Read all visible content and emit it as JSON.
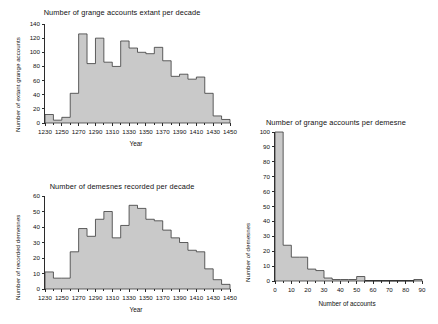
{
  "figure": {
    "background": "#ffffff",
    "bar_fill": "#c9c9c9",
    "bar_stroke": "#3a3a3a"
  },
  "chart_data": [
    {
      "id": "grange-accounts-per-decade",
      "type": "bar",
      "title": "Number of grange accounts extant per decade",
      "xlabel": "Year",
      "ylabel": "Number of extant grange accounts",
      "xlim": [
        1230,
        1450
      ],
      "ylim": [
        0,
        140
      ],
      "bin_width": 10,
      "grid": false,
      "legend": "none",
      "xticks": [
        1230,
        1250,
        1270,
        1290,
        1310,
        1330,
        1350,
        1370,
        1390,
        1410,
        1430,
        1450
      ],
      "yticks": [
        0,
        20,
        40,
        60,
        80,
        100,
        120,
        140
      ],
      "categories": [
        1230,
        1240,
        1250,
        1260,
        1270,
        1280,
        1290,
        1300,
        1310,
        1320,
        1330,
        1340,
        1350,
        1360,
        1370,
        1380,
        1390,
        1400,
        1410,
        1420,
        1430,
        1440
      ],
      "values": [
        12,
        4,
        8,
        42,
        126,
        84,
        120,
        86,
        80,
        116,
        106,
        100,
        98,
        107,
        88,
        66,
        69,
        62,
        65,
        42,
        10,
        5
      ]
    },
    {
      "id": "demesnes-recorded-per-decade",
      "type": "bar",
      "title": "Number of demesnes recorded per decade",
      "xlabel": "Year",
      "ylabel": "Number of recorded demesnes",
      "xlim": [
        1230,
        1450
      ],
      "ylim": [
        0,
        60
      ],
      "bin_width": 10,
      "grid": false,
      "legend": "none",
      "xticks": [
        1230,
        1250,
        1270,
        1290,
        1310,
        1330,
        1350,
        1370,
        1390,
        1410,
        1430,
        1450
      ],
      "yticks": [
        0,
        10,
        20,
        30,
        40,
        50,
        60
      ],
      "categories": [
        1230,
        1240,
        1250,
        1260,
        1270,
        1280,
        1290,
        1300,
        1310,
        1320,
        1330,
        1340,
        1350,
        1360,
        1370,
        1380,
        1390,
        1400,
        1410,
        1420,
        1430,
        1440
      ],
      "values": [
        11,
        7,
        7,
        24,
        39,
        34,
        45,
        50,
        33,
        41,
        54,
        52,
        45,
        44,
        38,
        33,
        30,
        25,
        24,
        13,
        6,
        3
      ]
    },
    {
      "id": "grange-accounts-per-demesne",
      "type": "bar",
      "title": "Number of grange accounts per demesne",
      "xlabel": "Number of accounts",
      "ylabel": "Number of demesnes",
      "xlim": [
        0,
        90
      ],
      "ylim": [
        0,
        100
      ],
      "bin_width": 5,
      "grid": false,
      "legend": "none",
      "xticks": [
        0,
        10,
        20,
        30,
        40,
        50,
        60,
        70,
        80,
        90
      ],
      "yticks": [
        0,
        10,
        20,
        30,
        40,
        50,
        60,
        70,
        80,
        90,
        100
      ],
      "categories": [
        0,
        5,
        10,
        15,
        20,
        25,
        30,
        35,
        40,
        45,
        50,
        55,
        60,
        65,
        70,
        75,
        80,
        85
      ],
      "values": [
        100,
        24,
        16,
        16,
        8,
        7,
        2,
        1,
        1,
        1,
        3,
        0,
        0,
        0,
        0,
        0,
        0,
        1
      ]
    }
  ]
}
